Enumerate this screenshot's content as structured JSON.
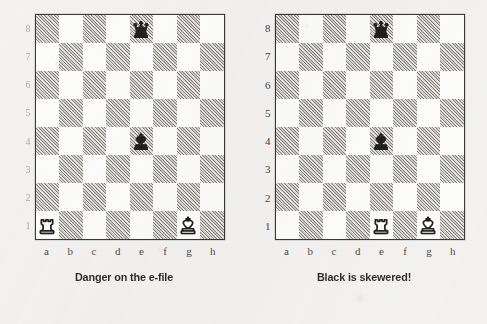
{
  "page": {
    "background_color": "#f2f1ef",
    "ink_color": "#1e1e1e"
  },
  "board_style": {
    "light_square_color": "#fcfcfb",
    "dark_square_color": "#e6e5e2",
    "hatch_color": "#5c5a57",
    "border_color": "#2b2b2b"
  },
  "diagrams": [
    {
      "id": "left-diagram",
      "caption": "Danger on the e-file",
      "ranks_degraded": true,
      "rank_labels": [
        "8",
        "7",
        "6",
        "5",
        "4",
        "3",
        "2",
        "1"
      ],
      "file_labels": [
        "a",
        "b",
        "c",
        "d",
        "e",
        "f",
        "g",
        "h"
      ],
      "pieces": [
        {
          "square": "e8",
          "color": "black",
          "type": "queen",
          "icon": "black-queen-icon"
        },
        {
          "square": "e4",
          "color": "black",
          "type": "king",
          "icon": "black-king-icon"
        },
        {
          "square": "a1",
          "color": "white",
          "type": "rook",
          "icon": "white-rook-icon"
        },
        {
          "square": "g1",
          "color": "white",
          "type": "king",
          "icon": "white-king-icon"
        }
      ]
    },
    {
      "id": "right-diagram",
      "caption": "Black is skewered!",
      "ranks_degraded": false,
      "rank_labels": [
        "8",
        "7",
        "6",
        "5",
        "4",
        "3",
        "2",
        "1"
      ],
      "file_labels": [
        "a",
        "b",
        "c",
        "d",
        "e",
        "f",
        "g",
        "h"
      ],
      "pieces": [
        {
          "square": "e8",
          "color": "black",
          "type": "queen",
          "icon": "black-queen-icon"
        },
        {
          "square": "e4",
          "color": "black",
          "type": "king",
          "icon": "black-king-icon"
        },
        {
          "square": "e1",
          "color": "white",
          "type": "rook",
          "icon": "white-rook-icon"
        },
        {
          "square": "g1",
          "color": "white",
          "type": "king",
          "icon": "white-king-icon"
        }
      ]
    }
  ]
}
